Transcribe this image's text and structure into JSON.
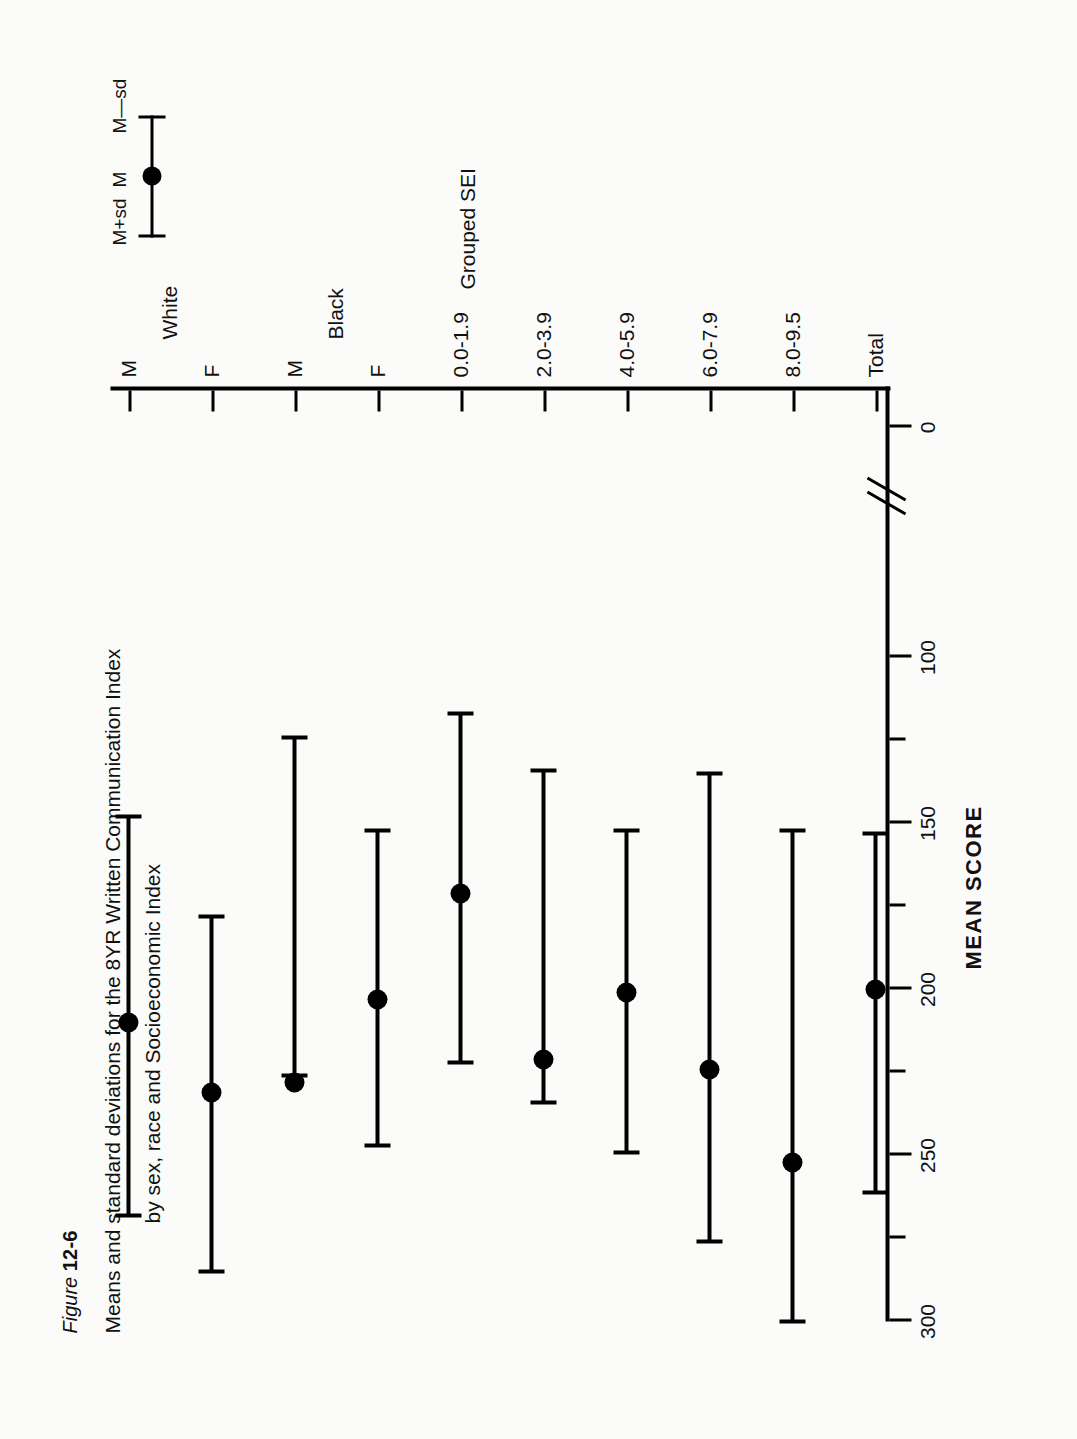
{
  "figure": {
    "number_prefix": "Figure",
    "number": "12-6",
    "title_line1": "Means and standard deviations for the 8YR Written Communication Index",
    "title_line2": "by sex, race and Socioeconomic Index"
  },
  "legend": {
    "upper_label": "M+sd",
    "mean_label": "M",
    "lower_label": "M—sd"
  },
  "axes": {
    "value_axis_title": "MEAN SCORE",
    "category_axis_title": "Grouped SEI",
    "value_ticks": [
      300,
      250,
      200,
      150,
      100,
      0
    ],
    "value_tick_labels": [
      "300",
      "250",
      "200",
      "150",
      "100",
      "0"
    ],
    "has_axis_break": true
  },
  "groups": [
    {
      "label": "White",
      "members": [
        "M",
        "F"
      ]
    },
    {
      "label": "Black",
      "members": [
        "M",
        "F"
      ]
    }
  ],
  "chart_data": {
    "type": "scatter",
    "title": "Means and standard deviations for the 8YR Written Communication Index by sex, race and Socioeconomic Index",
    "xlabel": "Grouped SEI",
    "ylabel": "MEAN SCORE",
    "ylim": [
      0,
      300
    ],
    "grid": false,
    "legend_position": "top-right",
    "orientation": "horizontal-errorbars",
    "categories": [
      "M",
      "F",
      "M",
      "F",
      "0.0-1.9",
      "2.0-3.9",
      "4.0-5.9",
      "6.0-7.9",
      "8.0-9.5",
      "Total"
    ],
    "category_groups": [
      "White",
      "White",
      "Black",
      "Black",
      "Grouped SEI",
      "Grouped SEI",
      "Grouped SEI",
      "Grouped SEI",
      "Grouped SEI",
      ""
    ],
    "series": [
      {
        "name": "M",
        "values": [
          210,
          231,
          228,
          203,
          171,
          221,
          201,
          224,
          252,
          200
        ]
      },
      {
        "name": "M—sd",
        "values": [
          148,
          178,
          124,
          152,
          117,
          134,
          152,
          135,
          152,
          153
        ]
      },
      {
        "name": "M+sd",
        "values": [
          268,
          285,
          226,
          247,
          222,
          234,
          249,
          276,
          300,
          261
        ]
      }
    ],
    "error_bars": [
      {
        "category": "M",
        "group": "White",
        "mean": 210,
        "low": 148,
        "high": 268
      },
      {
        "category": "F",
        "group": "White",
        "mean": 231,
        "low": 178,
        "high": 285
      },
      {
        "category": "M",
        "group": "Black",
        "mean": 228,
        "low": 124,
        "high": 226
      },
      {
        "category": "F",
        "group": "Black",
        "mean": 203,
        "low": 152,
        "high": 247
      },
      {
        "category": "0.0-1.9",
        "group": "Grouped SEI",
        "mean": 171,
        "low": 117,
        "high": 222
      },
      {
        "category": "2.0-3.9",
        "group": "Grouped SEI",
        "mean": 221,
        "low": 134,
        "high": 234
      },
      {
        "category": "4.0-5.9",
        "group": "Grouped SEI",
        "mean": 201,
        "low": 152,
        "high": 249
      },
      {
        "category": "6.0-7.9",
        "group": "Grouped SEI",
        "mean": 224,
        "low": 135,
        "high": 276
      },
      {
        "category": "8.0-9.5",
        "group": "Grouped SEI",
        "mean": 252,
        "low": 152,
        "high": 300
      },
      {
        "category": "Total",
        "group": "",
        "mean": 200,
        "low": 153,
        "high": 261
      }
    ]
  }
}
